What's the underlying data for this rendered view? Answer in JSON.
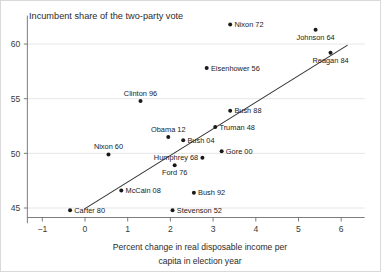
{
  "chart_data": {
    "type": "scatter",
    "title": "Incumbent share of the two-party vote",
    "xlabel_line1": "Percent change in real disposable income per",
    "xlabel_line2": "capita in election year",
    "ylabel": "Incumbent share of the two-party vote",
    "xlim": [
      -1.35,
      6.55
    ],
    "ylim": [
      43.6,
      62.6
    ],
    "xticks": [
      -1,
      0,
      1,
      2,
      3,
      4,
      5,
      6
    ],
    "xtick_labels": [
      "−1",
      "0",
      "1",
      "2",
      "3",
      "4",
      "5",
      "6"
    ],
    "yticks": [
      45,
      50,
      55,
      60
    ],
    "ytick_labels": [
      "45",
      "50",
      "55",
      "60"
    ],
    "grid": "horizontal",
    "legend": "none",
    "point_color": "#1a1a1a",
    "gridline_color": "#dfdfdf",
    "axis_color": "#6e6e6e",
    "trendline_color": "#333333",
    "trendline": {
      "label": "regression line",
      "x1": -0.02,
      "y1": 44.9,
      "x2": 6.15,
      "y2": 59.9
    },
    "points": [
      {
        "label": "Nixon 72",
        "x": 3.4,
        "y": 61.8,
        "label_pos": "right"
      },
      {
        "label": "Johnson 64",
        "x": 5.4,
        "y": 61.3,
        "label_pos": "below"
      },
      {
        "label": "Reagan 84",
        "x": 5.75,
        "y": 59.2,
        "label_pos": "below"
      },
      {
        "label": "Eisenhower 56",
        "x": 2.85,
        "y": 57.8,
        "label_pos": "right"
      },
      {
        "label": "Clinton 96",
        "x": 1.3,
        "y": 54.8,
        "label_pos": "above"
      },
      {
        "label": "Bush 88",
        "x": 3.4,
        "y": 53.9,
        "label_pos": "right"
      },
      {
        "label": "Truman 48",
        "x": 3.05,
        "y": 52.4,
        "label_pos": "right"
      },
      {
        "label": "Obama 12",
        "x": 1.95,
        "y": 51.5,
        "label_pos": "above"
      },
      {
        "label": "Bush 04",
        "x": 2.3,
        "y": 51.2,
        "label_pos": "right"
      },
      {
        "label": "Nixon 60",
        "x": 0.55,
        "y": 49.9,
        "label_pos": "above"
      },
      {
        "label": "Gore 00",
        "x": 3.2,
        "y": 50.2,
        "label_pos": "right"
      },
      {
        "label": "Humphrey 68",
        "x": 2.75,
        "y": 49.6,
        "label_pos": "left"
      },
      {
        "label": "Ford 76",
        "x": 2.1,
        "y": 48.9,
        "label_pos": "below"
      },
      {
        "label": "McCain 08",
        "x": 0.85,
        "y": 46.6,
        "label_pos": "right"
      },
      {
        "label": "Bush 92",
        "x": 2.55,
        "y": 46.4,
        "label_pos": "right"
      },
      {
        "label": "Carter 80",
        "x": -0.35,
        "y": 44.8,
        "label_pos": "right"
      },
      {
        "label": "Stevenson 52",
        "x": 2.05,
        "y": 44.8,
        "label_pos": "right"
      }
    ]
  }
}
